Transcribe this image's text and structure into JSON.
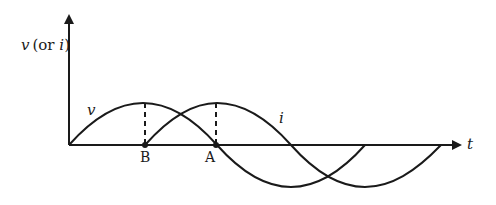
{
  "diagram": {
    "type": "phase-shifted sinusoids (v leads i)",
    "y_axis_label": {
      "var": "v",
      "paren_open": "(or ",
      "alt_var": "i",
      "paren_close": ")"
    },
    "x_axis_label": "t",
    "curves": [
      {
        "name": "v",
        "label": "v",
        "phase_offset": 0
      },
      {
        "name": "i",
        "label": "i",
        "phase_offset": "quarter period lag"
      }
    ],
    "points": [
      {
        "label": "B",
        "description": "peak of v projected to t-axis; start of i"
      },
      {
        "label": "A",
        "description": "peak of i projected to t-axis; zero crossing of v"
      }
    ],
    "colors": {
      "stroke": "#1a1a1a",
      "background": "#ffffff"
    }
  }
}
